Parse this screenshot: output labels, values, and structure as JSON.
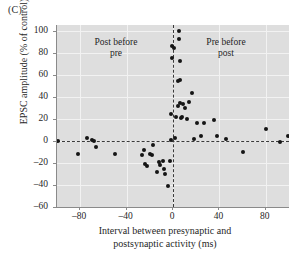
{
  "panel": {
    "label": "(C)"
  },
  "chart_data": {
    "type": "scatter",
    "title": "",
    "xlabel_line1": "Interval between presynaptic and",
    "xlabel_line2": "postsynaptic activity (ms)",
    "xlabel": "Interval between presynaptic and postsynaptic activity (ms)",
    "ylabel": "EPSC amplitude (% of control)",
    "xlim": [
      -100,
      100
    ],
    "ylim": [
      -60,
      105
    ],
    "xticks": [
      -80,
      -40,
      0,
      40,
      80
    ],
    "yticks": [
      100,
      80,
      60,
      40,
      20,
      0,
      -20,
      -40,
      -60
    ],
    "grid": true,
    "legend": "none",
    "marker_color": "#151515",
    "plot_background": "#dedede",
    "gridline_color": "#f2f2f2",
    "reference_lines": [
      {
        "name": "zero-amplitude-line",
        "axis": "horizontal",
        "value": 0,
        "style": "dashed"
      },
      {
        "name": "zero-interval-line",
        "axis": "vertical",
        "value": 0,
        "style": "dashed"
      }
    ],
    "annotations": [
      {
        "name": "post-before-pre",
        "text_line1": "Post before",
        "text_line2": "pre",
        "text": "Post before pre",
        "x": -55,
        "y": 85
      },
      {
        "name": "pre-before-post",
        "text_line1": "Pre before",
        "text_line2": "post",
        "text": "Pre before post",
        "x": 45,
        "y": 85
      }
    ],
    "series": [
      {
        "name": "EPSC amplitude change",
        "points": [
          [
            -99,
            0
          ],
          [
            -82,
            -12
          ],
          [
            -74,
            3
          ],
          [
            -70,
            1
          ],
          [
            -68,
            0
          ],
          [
            -66,
            -6
          ],
          [
            -50,
            -12
          ],
          [
            -27,
            -13
          ],
          [
            -25,
            -8
          ],
          [
            -24,
            -21
          ],
          [
            -22,
            -23
          ],
          [
            -20,
            -12
          ],
          [
            -18,
            -13
          ],
          [
            -17,
            -4
          ],
          [
            -14,
            -28
          ],
          [
            -12,
            -19
          ],
          [
            -11,
            -22
          ],
          [
            -9,
            -18
          ],
          [
            -8,
            -26
          ],
          [
            -7,
            -30
          ],
          [
            -4,
            -41
          ],
          [
            -3,
            -18
          ],
          [
            -2,
            1
          ],
          [
            -2,
            24
          ],
          [
            -1,
            75
          ],
          [
            -1,
            86
          ],
          [
            1,
            84
          ],
          [
            2,
            3
          ],
          [
            3,
            22
          ],
          [
            4,
            32
          ],
          [
            4,
            54
          ],
          [
            5,
            100
          ],
          [
            5,
            92
          ],
          [
            6,
            72
          ],
          [
            6,
            55
          ],
          [
            6,
            34
          ],
          [
            7,
            21
          ],
          [
            8,
            22
          ],
          [
            9,
            33
          ],
          [
            10,
            30
          ],
          [
            12,
            20
          ],
          [
            14,
            35
          ],
          [
            16,
            43
          ],
          [
            18,
            2
          ],
          [
            21,
            16
          ],
          [
            24,
            4
          ],
          [
            27,
            16
          ],
          [
            35,
            19
          ],
          [
            38,
            4
          ],
          [
            46,
            2
          ],
          [
            60,
            -10
          ],
          [
            80,
            11
          ],
          [
            92,
            -1
          ],
          [
            99,
            4
          ]
        ]
      }
    ]
  }
}
